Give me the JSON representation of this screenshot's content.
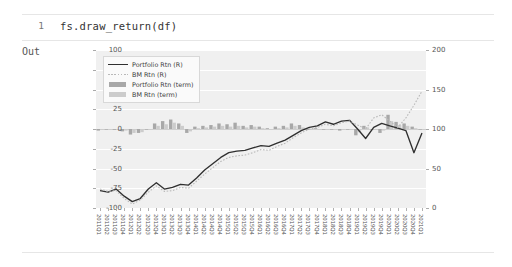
{
  "notebook": {
    "prompt_number": "1",
    "code": "fs.draw_return(df)",
    "out_label": "Out"
  },
  "colors": {
    "portfolio_line": "#303030",
    "bm_line": "#b9b9b9",
    "portfolio_bar": "#a8a8a8",
    "bm_bar": "#cccccc",
    "plot_background": "#f0f0f0",
    "grid": "#ffffff",
    "axis_text": "#555555"
  },
  "chart_data": {
    "type": "line",
    "title": "",
    "xlabel": "",
    "ylabel": "",
    "ylim": [
      -100,
      100
    ],
    "ylim_right": [
      0,
      200
    ],
    "yticks": [
      "100",
      "75",
      "50",
      "25",
      "0",
      "-25",
      "-50",
      "-75",
      "-100"
    ],
    "yticks_right": [
      "200",
      "150",
      "100",
      "50",
      "0"
    ],
    "grid": true,
    "legend_position": "upper-left",
    "categories": [
      "2011Q1",
      "2011Q2",
      "2011Q3",
      "2011Q4",
      "2012Q1",
      "2012Q2",
      "2012Q3",
      "2012Q4",
      "2013Q1",
      "2013Q2",
      "2013Q3",
      "2013Q4",
      "2014Q1",
      "2014Q2",
      "2014Q3",
      "2014Q4",
      "2015Q1",
      "2015Q2",
      "2015Q3",
      "2015Q4",
      "2016Q1",
      "2016Q2",
      "2016Q3",
      "2016Q4",
      "2017Q1",
      "2017Q2",
      "2017Q3",
      "2017Q4",
      "2018Q1",
      "2018Q2",
      "2018Q3",
      "2018Q4",
      "2019Q1",
      "2019Q2",
      "2019Q3",
      "2019Q4",
      "2020Q1",
      "2020Q2",
      "2020Q3",
      "2020Q4",
      "2021Q1"
    ],
    "series": [
      {
        "name": "Portfolio Rtn (R)",
        "axis": "left",
        "style": "solid",
        "color": "#303030",
        "values": [
          -78,
          -80,
          -76,
          -85,
          -92,
          -88,
          -76,
          -68,
          -76,
          -74,
          -70,
          -71,
          -62,
          -52,
          -44,
          -36,
          -30,
          -28,
          -27,
          -24,
          -21,
          -22,
          -18,
          -14,
          -8,
          -2,
          2,
          4,
          9,
          6,
          10,
          11,
          0,
          -12,
          2,
          7,
          4,
          1,
          -2,
          -30,
          -5
        ]
      },
      {
        "name": "BM Rtn (R)",
        "axis": "left",
        "style": "dotted",
        "color": "#b9b9b9",
        "values": [
          -76,
          -79,
          -78,
          -88,
          -95,
          -90,
          -80,
          -72,
          -79,
          -78,
          -74,
          -75,
          -66,
          -57,
          -49,
          -41,
          -36,
          -34,
          -33,
          -30,
          -26,
          -27,
          -22,
          -18,
          -11,
          -5,
          0,
          2,
          6,
          4,
          8,
          10,
          5,
          0,
          14,
          18,
          10,
          2,
          14,
          30,
          48
        ]
      },
      {
        "name": "Portfolio Rtn (term)",
        "axis": "right",
        "style": "bar",
        "color": "#a8a8a8",
        "values": [
          98,
          100,
          99,
          97,
          93,
          95,
          100,
          107,
          110,
          112,
          107,
          95,
          103,
          104,
          105,
          107,
          106,
          108,
          104,
          105,
          103,
          101,
          103,
          104,
          107,
          105,
          99,
          101,
          100,
          100,
          98,
          100,
          92,
          104,
          100,
          95,
          118,
          109,
          107,
          103,
          100
        ]
      },
      {
        "name": "BM Rtn (term)",
        "axis": "right",
        "style": "bar",
        "color": "#cccccc",
        "values": [
          99,
          100,
          100,
          98,
          95,
          96,
          100,
          104,
          106,
          108,
          104,
          97,
          101,
          102,
          103,
          104,
          103,
          104,
          102,
          103,
          101,
          100,
          101,
          102,
          104,
          102,
          100,
          100,
          100,
          100,
          99,
          100,
          96,
          102,
          100,
          98,
          110,
          105,
          104,
          101,
          100
        ]
      }
    ],
    "legend": [
      {
        "label": "Portfolio Rtn (R)",
        "key": "solid-line"
      },
      {
        "label": "BM Rtn (R)",
        "key": "dotted-line"
      },
      {
        "label": "Portfolio Rtn (term)",
        "key": "bar-dark"
      },
      {
        "label": "BM Rtn (term)",
        "key": "bar-light"
      }
    ]
  }
}
